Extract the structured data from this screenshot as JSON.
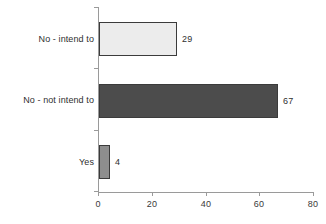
{
  "chart_data": {
    "type": "bar",
    "orientation": "horizontal",
    "title": "",
    "xlabel": "",
    "ylabel": "",
    "categories": [
      "No - intend to",
      "No - not intend to",
      "Yes"
    ],
    "values": [
      29,
      67,
      4
    ],
    "value_labels": [
      "29",
      "67",
      "4"
    ],
    "xlim": [
      0,
      80
    ],
    "xticks": [
      0,
      20,
      40,
      60,
      80
    ],
    "xtick_labels": [
      "0",
      "20",
      "40",
      "60",
      "80"
    ],
    "grid": false,
    "legend": false,
    "bar_colors": [
      "#ececec",
      "#4c4c4c",
      "#8e8e8e"
    ],
    "bar_border_color": "#3b3b3b",
    "axis_color": "#9a9a9a",
    "text_color": "#2f2f2f",
    "background": "#ffffff"
  }
}
